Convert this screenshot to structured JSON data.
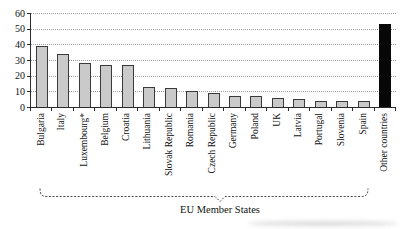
{
  "chart_data": {
    "type": "bar",
    "title": "",
    "xlabel": "",
    "ylabel": "",
    "categories": [
      "Bulgaria",
      "Italy",
      "Luxembourg*",
      "Belgium",
      "Croatia",
      "Lithuania",
      "Slovak Republic",
      "Romania",
      "Czech Republic",
      "Germany",
      "Poland",
      "UK",
      "Latvia",
      "Portugal",
      "Slovenia",
      "Spain",
      "Other countries"
    ],
    "values": [
      39,
      34,
      28,
      27,
      27,
      13,
      12,
      10,
      9,
      7,
      7,
      6,
      5,
      4,
      4,
      4,
      53
    ],
    "ylim": [
      0,
      60
    ],
    "yticks": [
      0,
      10,
      20,
      30,
      40,
      50,
      60
    ],
    "grid": "horizontal dotted gridlines at every y tick",
    "legend": "none",
    "highlight_categories": [
      "Other countries"
    ],
    "annotation": {
      "brace_label": "EU Member States",
      "brace_covers": "Bulgaria through Spain"
    }
  },
  "colors": {
    "bar_fill": "#cacaca",
    "bar_border": "#3a3a3a",
    "highlight_fill": "#070707",
    "axis": "#2b2b2b",
    "gridline": "#9c9c9c",
    "text": "#111111",
    "background": "#ffffff"
  }
}
